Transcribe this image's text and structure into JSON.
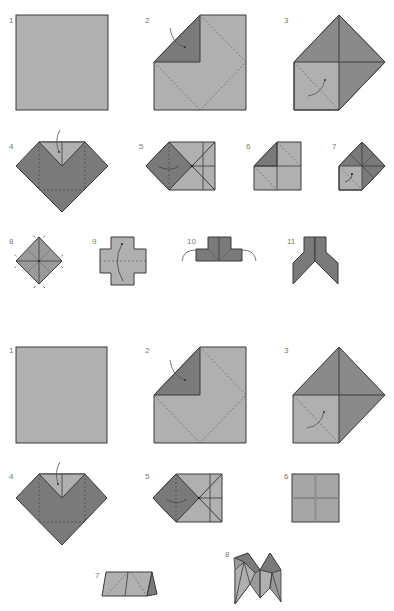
{
  "colors": {
    "light": "#b0b0b0",
    "dark": "#7a7a7a",
    "stroke": "#3a3a3a",
    "dashed": "#555555",
    "arrow": "#555555",
    "label": "#777777"
  },
  "sections": [
    {
      "name": "upper-sequence",
      "steps": [
        {
          "label": "1",
          "desc": "Plain square"
        },
        {
          "label": "2",
          "desc": "Fold corner to center"
        },
        {
          "label": "3",
          "desc": "Fold remaining corners to center"
        },
        {
          "label": "4",
          "desc": "Fold top edge down"
        },
        {
          "label": "5",
          "desc": "Fold left point to center"
        },
        {
          "label": "6",
          "desc": "Turn over"
        },
        {
          "label": "7",
          "desc": "Fold corners to center"
        },
        {
          "label": "8",
          "desc": "Pre-crease diagonals"
        },
        {
          "label": "9",
          "desc": "Fold in half"
        },
        {
          "label": "10",
          "desc": "Fold flaps outward"
        },
        {
          "label": "11",
          "desc": "Finished shape"
        }
      ]
    },
    {
      "name": "lower-sequence",
      "steps": [
        {
          "label": "1",
          "desc": "Plain square"
        },
        {
          "label": "2",
          "desc": "Fold corner to center"
        },
        {
          "label": "3",
          "desc": "Fold remaining corners to center"
        },
        {
          "label": "4",
          "desc": "Fold top edge down"
        },
        {
          "label": "5",
          "desc": "Fold left point to center"
        },
        {
          "label": "6",
          "desc": "Square with crease cross"
        },
        {
          "label": "7",
          "desc": "Fold in half"
        },
        {
          "label": "8",
          "desc": "Finished fortune teller"
        }
      ]
    }
  ]
}
